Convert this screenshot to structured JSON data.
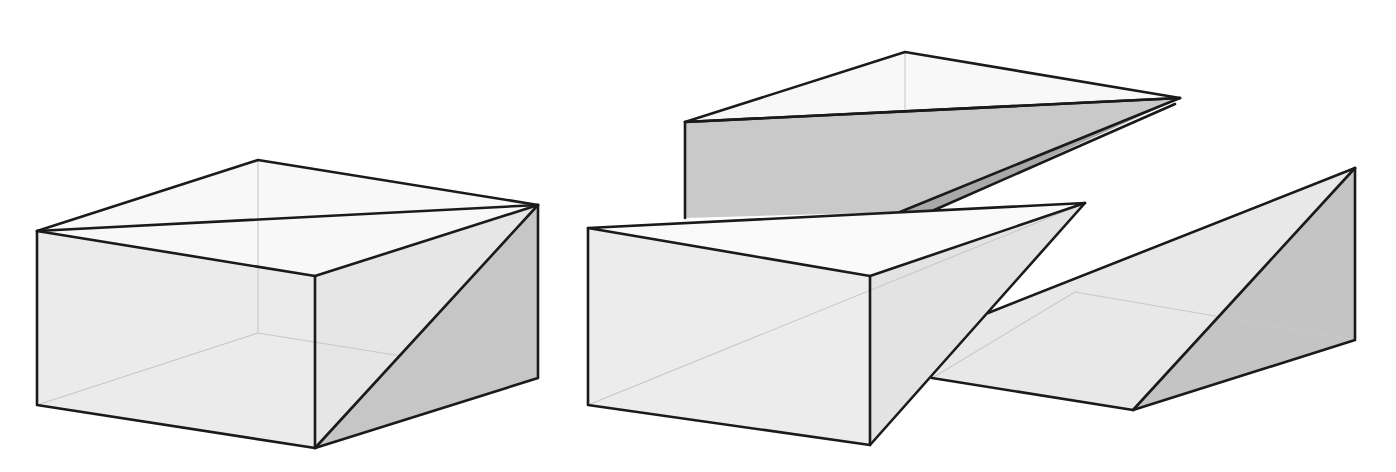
{
  "figure": {
    "colors": {
      "background": "#ffffff",
      "edge": "#1a1a1a",
      "hidden_edge": "#c8c8c8",
      "light_face": "#ececec",
      "top_face": "#f7f7f7",
      "shaded_face": "#c9c9c9",
      "dark_face": "#b4b4b4"
    },
    "pieces": [
      {
        "name": "assembled-box",
        "label": ""
      },
      {
        "name": "upper-wedge",
        "label": ""
      },
      {
        "name": "front-wedge",
        "label": ""
      },
      {
        "name": "right-wedge",
        "label": ""
      }
    ]
  }
}
